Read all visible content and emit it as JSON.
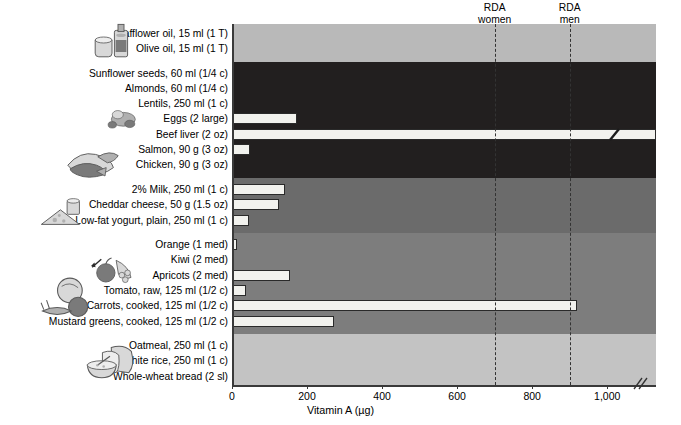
{
  "chart_data": {
    "type": "bar",
    "orientation": "horizontal",
    "title": "",
    "xlabel": "Vitamin A (µg)",
    "ylabel": "",
    "xlim": [
      0,
      1130
    ],
    "xticks": [
      0,
      200,
      400,
      600,
      800,
      1000
    ],
    "xticklabels": [
      "0",
      "200",
      "400",
      "600",
      "800",
      "1,000"
    ],
    "grid": false,
    "axis_break": true,
    "axis_break_note": "double-slash break after 1,000",
    "categories": [
      "Safflower oil, 15 ml (1 T)",
      "Olive oil, 15 ml (1 T)",
      "Sunflower seeds, 60 ml (1/4 c)",
      "Almonds, 60 ml (1/4 c)",
      "Lentils, 250 ml (1 c)",
      "Eggs (2 large)",
      "Beef liver (2 oz)",
      "Salmon, 90 g (3 oz)",
      "Chicken, 90 g (3 oz)",
      "2% Milk, 250 ml (1 c)",
      "Cheddar cheese, 50 g (1.5 oz)",
      "Low-fat yogurt, plain, 250 ml (1 c)",
      "Orange (1 med)",
      "Kiwi (2 med)",
      "Apricots (2 med)",
      "Tomato, raw, 125 ml (1/2 c)",
      "Carrots, cooked, 125 ml (1/2 c)",
      "Mustard greens, cooked, 125 ml (1/2 c)",
      "Oatmeal, 250 ml (1 c)",
      "White rice, 250 ml (1 c)",
      "Whole-wheat bread (2 sl)"
    ],
    "values": [
      0,
      0,
      0,
      0,
      0,
      173,
      1130,
      48,
      5,
      140,
      125,
      45,
      13,
      5,
      155,
      38,
      920,
      272,
      0,
      0,
      0
    ],
    "off_scale": [
      false,
      false,
      false,
      false,
      false,
      false,
      true,
      false,
      false,
      false,
      false,
      false,
      false,
      false,
      false,
      false,
      false,
      false,
      false,
      false,
      false
    ],
    "reference_lines": [
      {
        "label_line1": "RDA",
        "label_line2": "women",
        "value": 700
      },
      {
        "label_line1": "RDA",
        "label_line2": "men",
        "value": 900
      }
    ],
    "groups": [
      {
        "name": "oils",
        "color": "#b9b9b9",
        "start": 0,
        "end": 1,
        "illustration": "oil-bottle-and-cup-icon"
      },
      {
        "name": "protein",
        "color": "#221f1f",
        "start": 2,
        "end": 8,
        "illustration": "meat-fish-and-nuts-icon"
      },
      {
        "name": "dairy",
        "color": "#6b6b6b",
        "start": 9,
        "end": 11,
        "illustration": "cheese-and-milk-icon"
      },
      {
        "name": "fruits-and-vegetables",
        "color": "#7d7d7d",
        "start": 12,
        "end": 17,
        "illustration": "fruits-and-vegetables-icon"
      },
      {
        "name": "grains",
        "color": "#c3c3c3",
        "start": 18,
        "end": 20,
        "illustration": "bread-and-oatmeal-bowl-icon"
      }
    ],
    "bar_color": "#f2f2ee",
    "bar_edge_color": "#2a2a2a"
  }
}
